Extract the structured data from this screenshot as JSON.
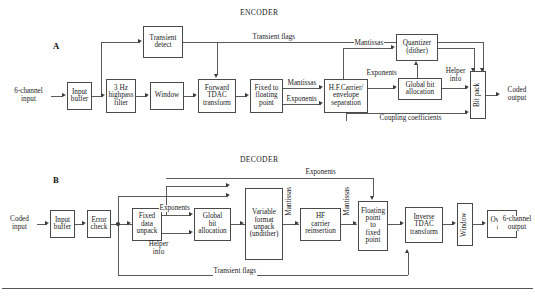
{
  "figure": {
    "panels": [
      {
        "letter": "A",
        "title": "ENCODER",
        "input_label": "6-channel\ninput",
        "output_label": "Coded\noutput",
        "blocks": [
          {
            "name": "input-buffer",
            "label": "Input\nbuffer"
          },
          {
            "name": "highpass-filter",
            "label": "3 Hz\nhighpass\nfilter"
          },
          {
            "name": "window",
            "label": "Window"
          },
          {
            "name": "forward-tdac-transform",
            "label": "Forward\nTDAC\ntransform"
          },
          {
            "name": "fixed-to-floating-point",
            "label": "Fixed to\nfloating\npoint"
          },
          {
            "name": "hf-carrier-envelope-separation",
            "label": "H.F.Carrier/\nenvelope\nseparation"
          },
          {
            "name": "transient-detect",
            "label": "Transient\ndetect"
          },
          {
            "name": "quantizer-dither",
            "label": "Quantizer\n(dither)"
          },
          {
            "name": "global-bit-allocation",
            "label": "Global bit\nallocation"
          },
          {
            "name": "bit-pack",
            "label": "Bit pack"
          }
        ],
        "signal_labels": [
          {
            "name": "transient-flags",
            "text": "Transient flags"
          },
          {
            "name": "mantissas-out",
            "text": "Mantissas"
          },
          {
            "name": "exponents-out",
            "text": "Exponents"
          },
          {
            "name": "mantissas-to-quantizer",
            "text": "Mantissas"
          },
          {
            "name": "exponents-to-allocation",
            "text": "Exponents"
          },
          {
            "name": "helper-info",
            "text": "Helper\ninfo"
          },
          {
            "name": "coupling-coefficients",
            "text": "Coupling coefficients"
          }
        ]
      },
      {
        "letter": "B",
        "title": "DECODER",
        "input_label": "Coded\ninput",
        "output_label": "6-channel\noutput",
        "blocks": [
          {
            "name": "input-buffer",
            "label": "Input\nbuffer"
          },
          {
            "name": "error-check",
            "label": "Error\ncheck"
          },
          {
            "name": "fixed-data-unpack",
            "label": "Fixed\ndata\nunpack"
          },
          {
            "name": "global-bit-allocation",
            "label": "Global\nbit\nallocation"
          },
          {
            "name": "variable-format-unpack-undither",
            "label": "Variable\nformat\nunpack\n(undither)"
          },
          {
            "name": "hf-carrier-reinsertion",
            "label": "HF\ncarrier\nreinsertion"
          },
          {
            "name": "floating-point-to-fixed-point",
            "label": "Floating\npoint\nto\nfixed\npoint"
          },
          {
            "name": "inverse-tdac-transform",
            "label": "Inverse\nTDAC\ntransform"
          },
          {
            "name": "window",
            "label": "Window"
          },
          {
            "name": "overlap-add",
            "label": "Overlap\nadd"
          }
        ],
        "signal_labels": [
          {
            "name": "exponents-top",
            "text": "Exponents"
          },
          {
            "name": "exponents-mid",
            "text": "Exponents"
          },
          {
            "name": "helper-info",
            "text": "Helper\ninfo"
          },
          {
            "name": "mantissas-1",
            "text": "Mantissas"
          },
          {
            "name": "mantissas-2",
            "text": "Mantissas"
          },
          {
            "name": "transient-flags",
            "text": "Transient flags"
          }
        ]
      }
    ],
    "colors": {
      "line": "#5a5a5a",
      "box_border": "#4a4a4a",
      "text": "#1a1a1a",
      "background": "#ffffff"
    }
  }
}
